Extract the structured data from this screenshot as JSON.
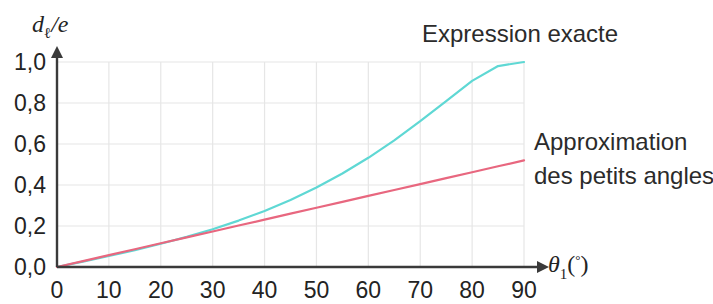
{
  "chart_data": {
    "type": "line",
    "title": "",
    "xlabel": "θ₁(°)",
    "ylabel": "dₗ/e",
    "xlim": [
      0,
      90
    ],
    "ylim": [
      0,
      1.0
    ],
    "xticks": [
      "0",
      "10",
      "20",
      "30",
      "40",
      "50",
      "60",
      "70",
      "80",
      "90"
    ],
    "xtick_values": [
      0,
      10,
      20,
      30,
      40,
      50,
      60,
      70,
      80,
      90
    ],
    "yticks": [
      "0,0",
      "0,2",
      "0,4",
      "0,6",
      "0,8",
      "1,0"
    ],
    "ytick_values": [
      0.0,
      0.2,
      0.4,
      0.6,
      0.8,
      1.0
    ],
    "grid": true,
    "grid_color": "#e6e6e6",
    "legend_position": "inline-annotations",
    "x": [
      0,
      5,
      10,
      15,
      20,
      25,
      30,
      35,
      40,
      45,
      50,
      55,
      60,
      65,
      70,
      75,
      80,
      85,
      90
    ],
    "series": [
      {
        "name": "Expression exacte",
        "color": "#5fd8d4",
        "values": [
          0.0,
          0.0264,
          0.0536,
          0.0823,
          0.1132,
          0.147,
          0.1845,
          0.2264,
          0.2736,
          0.327,
          0.3875,
          0.4559,
          0.5327,
          0.6181,
          0.7111,
          0.8093,
          0.9077,
          0.9802,
          1.0
        ]
      },
      {
        "name": "Approximation des petits angles",
        "color": "#e8677f",
        "values": [
          0.0,
          0.0289,
          0.0578,
          0.0867,
          0.1156,
          0.1445,
          0.1734,
          0.2023,
          0.2312,
          0.2601,
          0.289,
          0.3179,
          0.3468,
          0.3757,
          0.4046,
          0.4335,
          0.4624,
          0.4913,
          0.5202
        ]
      }
    ],
    "annotations": [
      {
        "text": "Expression exacte",
        "x_px": 422,
        "y_px": 42
      },
      {
        "text": "Approximation",
        "x_px": 534,
        "y_px": 150
      },
      {
        "text": "des petits angles",
        "x_px": 534,
        "y_px": 184
      }
    ]
  },
  "axes": {
    "y_axis_label": "d",
    "y_axis_label_sub": "ℓ",
    "y_axis_label_rest": "/e",
    "x_axis_label_theta": "θ",
    "x_axis_label_sub": "1",
    "x_axis_label_open": "(",
    "x_axis_label_deg": "°",
    "x_axis_label_close": ")",
    "axis_color": "#3a3a3a"
  }
}
